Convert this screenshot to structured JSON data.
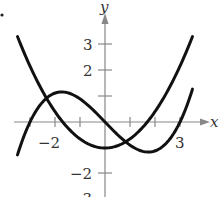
{
  "chart_data": {
    "type": "line",
    "title": "",
    "xlabel": "x",
    "ylabel": "y",
    "xlim": [
      -3.6,
      4.0
    ],
    "ylim": [
      -3,
      4.2
    ],
    "x_ticks": [
      -3,
      -2,
      -1,
      1,
      2,
      3
    ],
    "x_tick_labels": {
      "-2": "−2",
      "3": "3"
    },
    "y_ticks": [
      -3,
      -2,
      -1,
      1,
      2,
      3
    ],
    "y_tick_labels": {
      "3": "3",
      "2": "2",
      "-2": "−2",
      "-3": "−3"
    },
    "grid": false,
    "legend": null,
    "series": [
      {
        "name": "parabola",
        "formula": "0.35*x^2 - 1",
        "x": [
          -3.5,
          -3,
          -2,
          -1,
          0,
          1,
          2,
          3,
          3.5
        ],
        "y": [
          3.29,
          2.15,
          0.4,
          -0.65,
          -1.0,
          -0.65,
          0.4,
          2.15,
          3.29
        ]
      },
      {
        "name": "cubic",
        "formula": "x^3/9 - x",
        "x": [
          -3.5,
          -3,
          -2,
          -1.73,
          -1,
          0,
          1,
          1.73,
          2,
          3,
          3.5
        ],
        "y": [
          -1.26,
          0.0,
          1.11,
          1.15,
          0.89,
          0.0,
          -0.89,
          -1.15,
          -1.11,
          0.0,
          1.26
        ]
      }
    ],
    "annotations": [
      "bullet dot at top-left"
    ]
  },
  "labels": {
    "x_axis": "x",
    "y_axis": "y",
    "tick_x_neg2": "−2",
    "tick_x_3": "3",
    "tick_y_3": "3",
    "tick_y_2": "2",
    "tick_y_neg2": "−2",
    "tick_y_neg3": "−3"
  },
  "colors": {
    "curve": "#111111",
    "axis": "#888888",
    "text": "#333333"
  }
}
